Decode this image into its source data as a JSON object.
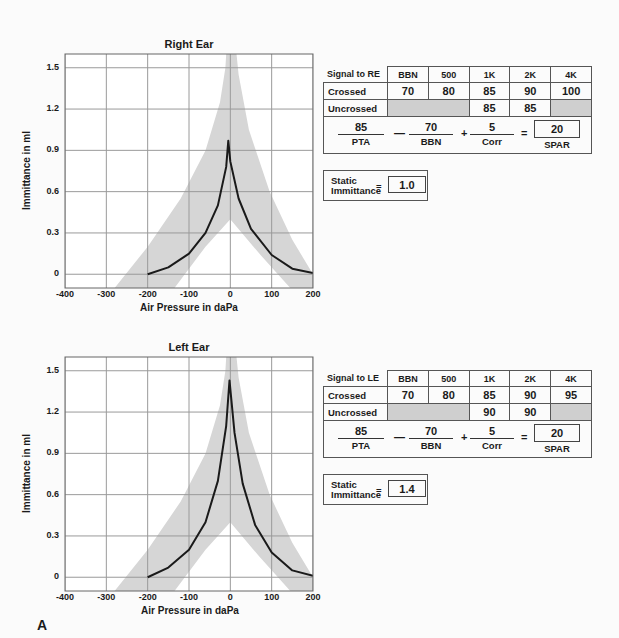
{
  "figure_label": "A",
  "chart_data": [
    {
      "type": "line",
      "title": "Right Ear",
      "xlabel": "Air Pressure in daPa",
      "ylabel": "Immittance in ml",
      "xlim": [
        -400,
        200
      ],
      "ylim": [
        -0.1,
        1.6
      ],
      "xticks": [
        "-400",
        "-300",
        "-200",
        "-100",
        "0",
        "100",
        "200"
      ],
      "yticks": [
        "0",
        "0.3",
        "0.6",
        "0.9",
        "1.2",
        "1.5"
      ],
      "grid": true,
      "series": [
        {
          "name": "tympanogram",
          "peak_x": -5,
          "peak_y": 0.97,
          "x": [
            -200,
            -150,
            -100,
            -60,
            -30,
            -10,
            -5,
            0,
            20,
            50,
            100,
            150,
            200
          ],
          "y": [
            0.0,
            0.05,
            0.15,
            0.3,
            0.5,
            0.78,
            0.97,
            0.82,
            0.55,
            0.33,
            0.14,
            0.04,
            0.01
          ]
        }
      ],
      "normal_range_band": {
        "outer_left": {
          "x": [
            -280,
            -200,
            -120,
            -60,
            -25,
            -12,
            -10
          ],
          "y": [
            -0.1,
            0.2,
            0.55,
            0.9,
            1.25,
            1.5,
            1.6
          ]
        },
        "outer_right": {
          "x": [
            15,
            20,
            45,
            95,
            150,
            200
          ],
          "y": [
            1.6,
            1.45,
            1.05,
            0.6,
            0.25,
            -0.0
          ]
        },
        "inner_left": {
          "x": [
            -135,
            -60,
            0
          ],
          "y": [
            -0.1,
            0.2,
            0.4
          ]
        },
        "inner_right": {
          "x": [
            0,
            70,
            145
          ],
          "y": [
            0.4,
            0.15,
            -0.1
          ]
        }
      }
    },
    {
      "type": "line",
      "title": "Left Ear",
      "xlabel": "Air Pressure in daPa",
      "ylabel": "Immittance in ml",
      "xlim": [
        -400,
        200
      ],
      "ylim": [
        -0.1,
        1.6
      ],
      "xticks": [
        "-400",
        "-300",
        "-200",
        "-100",
        "0",
        "100",
        "200"
      ],
      "yticks": [
        "0",
        "0.3",
        "0.6",
        "0.9",
        "1.2",
        "1.5"
      ],
      "grid": true,
      "series": [
        {
          "name": "tympanogram",
          "peak_x": -2,
          "peak_y": 1.43,
          "x": [
            -200,
            -150,
            -100,
            -60,
            -30,
            -10,
            -2,
            10,
            30,
            60,
            100,
            150,
            200
          ],
          "y": [
            0.0,
            0.07,
            0.2,
            0.4,
            0.7,
            1.1,
            1.43,
            1.05,
            0.68,
            0.38,
            0.18,
            0.05,
            0.01
          ]
        }
      ],
      "normal_range_band": {
        "outer_left": {
          "x": [
            -280,
            -200,
            -120,
            -60,
            -25,
            -12,
            -10
          ],
          "y": [
            -0.1,
            0.2,
            0.55,
            0.9,
            1.25,
            1.5,
            1.6
          ]
        },
        "outer_right": {
          "x": [
            15,
            20,
            45,
            95,
            150,
            200
          ],
          "y": [
            1.6,
            1.45,
            1.05,
            0.6,
            0.25,
            -0.0
          ]
        },
        "inner_left": {
          "x": [
            -135,
            -60,
            0
          ],
          "y": [
            -0.1,
            0.2,
            0.4
          ]
        },
        "inner_right": {
          "x": [
            0,
            70,
            145
          ],
          "y": [
            0.4,
            0.15,
            -0.1
          ]
        }
      }
    }
  ],
  "right": {
    "table": {
      "header": [
        "Signal to RE",
        "BBN",
        "500",
        "1K",
        "2K",
        "4K"
      ],
      "crossed_label": "Crossed",
      "crossed": [
        "70",
        "80",
        "85",
        "90",
        "100"
      ],
      "uncrossed_label": "Uncrossed",
      "uncrossed": [
        "",
        "",
        "85",
        "85",
        ""
      ]
    },
    "formula": {
      "pta": "85",
      "pta_label": "PTA",
      "minus": "—",
      "bbn": "70",
      "bbn_label": "BBN",
      "plus": "+",
      "corr": "5",
      "corr_label": "Corr",
      "equals": "=",
      "spar": "20",
      "spar_label": "SPAR"
    },
    "static": {
      "label_line1": "Static",
      "label_line2": "Immittance",
      "equals": "=",
      "value": "1.0"
    }
  },
  "left": {
    "table": {
      "header": [
        "Signal to LE",
        "BBN",
        "500",
        "1K",
        "2K",
        "4K"
      ],
      "crossed_label": "Crossed",
      "crossed": [
        "70",
        "80",
        "85",
        "90",
        "95"
      ],
      "uncrossed_label": "Uncrossed",
      "uncrossed": [
        "",
        "",
        "90",
        "90",
        ""
      ]
    },
    "formula": {
      "pta": "85",
      "pta_label": "PTA",
      "minus": "—",
      "bbn": "70",
      "bbn_label": "BBN",
      "plus": "+",
      "corr": "5",
      "corr_label": "Corr",
      "equals": "=",
      "spar": "20",
      "spar_label": "SPAR"
    },
    "static": {
      "label_line1": "Static",
      "label_line2": "Immittance",
      "equals": "=",
      "value": "1.4"
    }
  },
  "colors": {
    "band": "#d6d6d6",
    "grid": "#9a9a9a",
    "curve": "#1a1a1a",
    "shade_cell": "#cfcfcf"
  }
}
